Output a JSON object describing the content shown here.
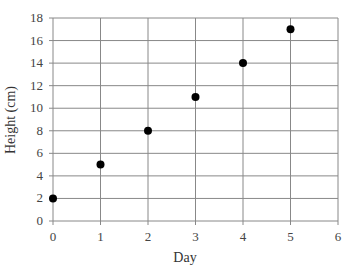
{
  "chart_data": {
    "type": "scatter",
    "title": "",
    "xlabel": "Day",
    "ylabel": "Height (cm)",
    "xlim": [
      0,
      6
    ],
    "ylim": [
      0,
      18
    ],
    "xticks": [
      0,
      1,
      2,
      3,
      4,
      5,
      6
    ],
    "yticks": [
      0,
      2,
      4,
      6,
      8,
      10,
      12,
      14,
      16,
      18
    ],
    "grid": true,
    "legend": null,
    "series": [
      {
        "name": "Height",
        "x": [
          0,
          1,
          2,
          3,
          4,
          5
        ],
        "y": [
          2,
          5,
          8,
          11,
          14,
          17
        ],
        "color": "#000000"
      }
    ]
  },
  "labels": {
    "x": "Day",
    "y": "Height (cm)"
  }
}
